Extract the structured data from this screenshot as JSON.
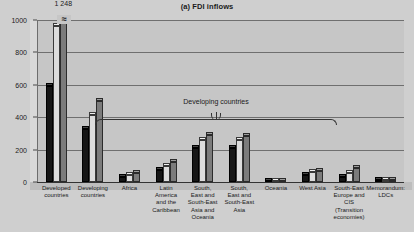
{
  "chart_data": {
    "type": "bar",
    "title": "(a) FDI inflows",
    "xlabel": "",
    "ylabel": "",
    "ylim": [
      0,
      1000
    ],
    "yticks": [
      0,
      200,
      400,
      600,
      800,
      1000
    ],
    "grid": true,
    "legend_position": "top-right",
    "categories": [
      "Developed\ncountries",
      "Developing\ncountries",
      "Africa",
      "Latin\nAmerica\nand the\nCaribbean",
      "South,\nEast and\nSouth-East\nAsia and\nOceania",
      "South,\nEast and\nSouth-East\nAsia",
      "Oceania",
      "West Asia",
      "South-East\nEurope and\nCIS\n(Transition\neconomies)",
      "Memorandum:\nLDCs"
    ],
    "series": [
      {
        "name": "2005",
        "color": "#161616",
        "values": [
          590,
          330,
          30,
          76,
          210,
          207,
          3,
          44,
          31,
          10
        ]
      },
      {
        "name": "2006",
        "color": "#e4e4e4",
        "values": [
          960,
          415,
          46,
          98,
          260,
          257,
          3,
          63,
          57,
          13
        ]
      },
      {
        "name": "2007",
        "color": "#7b7b7b",
        "values": [
          1248,
          500,
          53,
          126,
          289,
          286,
          3,
          71,
          86,
          13
        ]
      }
    ],
    "data_labels": [
      {
        "series": "2007",
        "category": "Developed\ncountries",
        "text": "1 248",
        "clipped": true
      }
    ],
    "annotations": [
      {
        "text": "Developing countries",
        "type": "brace",
        "spans": [
          "Africa",
          "South, East and South-East Asia"
        ]
      }
    ]
  },
  "legend": {
    "items": [
      {
        "label": "2005"
      },
      {
        "label": "2006"
      },
      {
        "label": "2007"
      }
    ]
  }
}
